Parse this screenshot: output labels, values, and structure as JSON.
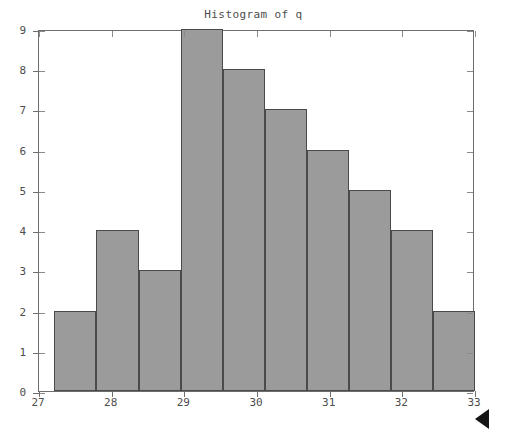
{
  "figure": {
    "title": "Histogram of q",
    "background_color": "#ffffff",
    "cursor_icon": "left-pointing-triangle-cursor"
  },
  "axes": {
    "frame_color": "#6e6e6e",
    "x_tick_labels": [
      "27",
      "28",
      "29",
      "30",
      "31",
      "32",
      "33"
    ],
    "y_tick_labels": [
      "0",
      "1",
      "2",
      "3",
      "4",
      "5",
      "6",
      "7",
      "8",
      "9"
    ]
  },
  "chart_data": {
    "type": "bar",
    "title": "Histogram of q",
    "xlabel": "",
    "ylabel": "",
    "xlim": [
      27,
      33
    ],
    "ylim": [
      0,
      9
    ],
    "grid": false,
    "legend": null,
    "bar_color": "#9b9b9b",
    "bar_edge_color": "#4a4a4a",
    "xticks": [
      27,
      28,
      29,
      30,
      31,
      32,
      33
    ],
    "yticks": [
      0,
      1,
      2,
      3,
      4,
      5,
      6,
      7,
      8,
      9
    ],
    "bin_edges": [
      27.21,
      27.79,
      28.37,
      28.95,
      29.53,
      30.11,
      30.69,
      31.27,
      31.85,
      32.42,
      33.0
    ],
    "categories": [
      "27.21-27.79",
      "27.79-28.37",
      "28.37-28.95",
      "28.95-29.53",
      "29.53-30.11",
      "30.11-30.69",
      "30.69-31.27",
      "31.27-31.85",
      "31.85-32.42",
      "32.42-33.00"
    ],
    "values": [
      2,
      4,
      3,
      9,
      8,
      7,
      6,
      5,
      4,
      2
    ],
    "bars": [
      {
        "left": 27.21,
        "right": 27.79,
        "count": 2
      },
      {
        "left": 27.79,
        "right": 28.37,
        "count": 4
      },
      {
        "left": 28.37,
        "right": 28.95,
        "count": 3
      },
      {
        "left": 28.95,
        "right": 29.53,
        "count": 9
      },
      {
        "left": 29.53,
        "right": 30.11,
        "count": 8
      },
      {
        "left": 30.11,
        "right": 30.69,
        "count": 7
      },
      {
        "left": 30.69,
        "right": 31.27,
        "count": 6
      },
      {
        "left": 31.27,
        "right": 31.85,
        "count": 5
      },
      {
        "left": 31.85,
        "right": 32.42,
        "count": 4
      },
      {
        "left": 32.42,
        "right": 33.0,
        "count": 2
      }
    ]
  }
}
